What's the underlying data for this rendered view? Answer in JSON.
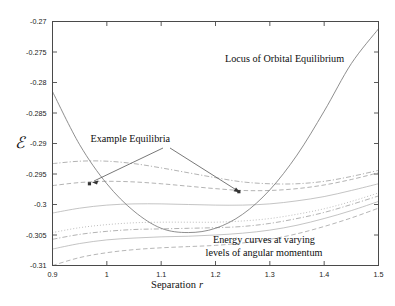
{
  "figure": {
    "background": "#ffffff",
    "frame_color": "#4a4a4a"
  },
  "annotations": {
    "locus_label": "Locus of Orbital Equilibrium",
    "example_label": "Example Equilibria",
    "energy_label_line1": "Energy curves at varying",
    "energy_label_line2": "levels of angular momentum"
  },
  "chart_data": {
    "type": "line",
    "title": "",
    "xlabel_text": "Separation",
    "xlabel_symbol": "r",
    "ylabel": "ℰ",
    "xlim": [
      0.9,
      1.5
    ],
    "ylim": [
      -0.31,
      -0.27
    ],
    "grid": false,
    "legend": "none",
    "xticks": [
      0.9,
      1.0,
      1.1,
      1.2,
      1.3,
      1.4,
      1.5
    ],
    "xtick_labels": [
      "0.9",
      "1",
      "1.1",
      "1.2",
      "1.3",
      "1.4",
      "1.5"
    ],
    "yticks": [
      -0.31,
      -0.305,
      -0.3,
      -0.295,
      -0.29,
      -0.285,
      -0.28,
      -0.275,
      -0.27
    ],
    "ytick_labels": [
      "-0.31",
      "-0.305",
      "-0.3",
      "-0.295",
      "-0.29",
      "-0.285",
      "-0.28",
      "-0.275",
      "-0.27"
    ],
    "x": [
      0.9,
      0.95,
      1.0,
      1.05,
      1.1,
      1.15,
      1.2,
      1.25,
      1.3,
      1.35,
      1.4,
      1.45,
      1.5
    ],
    "series": [
      {
        "name": "Locus of Orbital Equilibrium",
        "role": "locus",
        "color": "#7a7a7a",
        "dash": "solid",
        "values": [
          -0.2815,
          -0.2902,
          -0.2966,
          -0.3011,
          -0.3039,
          -0.3046,
          -0.3039,
          -0.3016,
          -0.2976,
          -0.2919,
          -0.2847,
          -0.2769,
          -0.2712
        ]
      },
      {
        "name": "Energy curve L1",
        "role": "energy",
        "color": "#9a9a9a",
        "dash": "dash-dot",
        "values": [
          -0.2933,
          -0.2929,
          -0.2929,
          -0.2933,
          -0.294,
          -0.2948,
          -0.2956,
          -0.2963,
          -0.2966,
          -0.2966,
          -0.2962,
          -0.2954,
          -0.2944
        ]
      },
      {
        "name": "Energy curve L2",
        "role": "energy",
        "color": "#9a9a9a",
        "dash": "dash",
        "values": [
          -0.2969,
          -0.2964,
          -0.2962,
          -0.2963,
          -0.2966,
          -0.297,
          -0.2974,
          -0.2977,
          -0.2977,
          -0.2974,
          -0.2968,
          -0.2959,
          -0.2948
        ]
      },
      {
        "name": "Energy curve L3",
        "role": "energy",
        "color": "#b0b0b0",
        "dash": "solid",
        "values": [
          -0.3014,
          -0.3006,
          -0.3001,
          -0.2999,
          -0.2999,
          -0.3,
          -0.3001,
          -0.3001,
          -0.2999,
          -0.2994,
          -0.2987,
          -0.2977,
          -0.2966
        ]
      },
      {
        "name": "Energy curve L4",
        "role": "energy",
        "color": "#a8a8a8",
        "dash": "dot",
        "values": [
          -0.3046,
          -0.3038,
          -0.3033,
          -0.303,
          -0.3029,
          -0.3029,
          -0.3029,
          -0.3027,
          -0.3023,
          -0.3016,
          -0.3007,
          -0.2995,
          -0.2981
        ]
      },
      {
        "name": "Energy curve L5",
        "role": "energy",
        "color": "#9a9a9a",
        "dash": "dash-dot",
        "values": [
          -0.3057,
          -0.3049,
          -0.3044,
          -0.3041,
          -0.304,
          -0.3039,
          -0.3038,
          -0.3036,
          -0.3031,
          -0.3023,
          -0.3013,
          -0.3,
          -0.2986
        ]
      },
      {
        "name": "Energy curve L6",
        "role": "energy",
        "color": "#b0b0b0",
        "dash": "solid",
        "values": [
          -0.3073,
          -0.3064,
          -0.3058,
          -0.3055,
          -0.3053,
          -0.3052,
          -0.305,
          -0.3047,
          -0.3042,
          -0.3034,
          -0.3023,
          -0.301,
          -0.2995
        ]
      },
      {
        "name": "Energy curve L7",
        "role": "energy",
        "color": "#9e9e9e",
        "dash": "dash",
        "values": [
          -0.31,
          -0.3087,
          -0.3079,
          -0.3074,
          -0.3071,
          -0.3069,
          -0.3067,
          -0.3063,
          -0.3057,
          -0.3048,
          -0.3036,
          -0.3022,
          -0.3006
        ]
      }
    ],
    "markers": [
      {
        "name": "example-equilibrium-left",
        "x": 0.968,
        "y": -0.2966
      },
      {
        "name": "example-equilibrium-right",
        "x": 1.243,
        "y": -0.2979
      }
    ]
  }
}
